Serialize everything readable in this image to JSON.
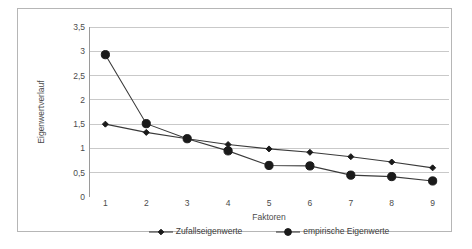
{
  "chart_data": {
    "type": "line",
    "title": "",
    "xlabel": "Faktoren",
    "ylabel": "Eigenwertverlauf",
    "categories": [
      1,
      2,
      3,
      4,
      5,
      6,
      7,
      8,
      9
    ],
    "x": [
      1,
      2,
      3,
      4,
      5,
      6,
      7,
      8,
      9
    ],
    "xlim": [
      0.6,
      9.4
    ],
    "ylim": [
      0,
      3.5
    ],
    "y_ticks": [
      "0",
      "0,5",
      "1",
      "1,5",
      "2",
      "2,5",
      "3",
      "3,5"
    ],
    "y_tick_values": [
      0,
      0.5,
      1,
      1.5,
      2,
      2.5,
      3,
      3.5
    ],
    "x_ticks": [
      "1",
      "2",
      "3",
      "4",
      "5",
      "6",
      "7",
      "8",
      "9"
    ],
    "grid": "horizontal",
    "legend_position": "bottom",
    "series": [
      {
        "name": "Zufallseigenwerte",
        "values": [
          1.5,
          1.33,
          1.2,
          1.08,
          0.99,
          0.92,
          0.83,
          0.72,
          0.6
        ],
        "color": "#1a1a1a",
        "marker": "diamond"
      },
      {
        "name": "empirische Eigenwerte",
        "values": [
          2.93,
          1.51,
          1.2,
          0.95,
          0.65,
          0.64,
          0.45,
          0.42,
          0.33
        ],
        "color": "#1a1a1a",
        "marker": "circle"
      }
    ]
  },
  "axes": {
    "y_title": "Eigenwertverlauf",
    "x_title": "Faktoren"
  },
  "legend": {
    "items": [
      {
        "label": "Zufallseigenwerte"
      },
      {
        "label": "empirische Eigenwerte"
      }
    ]
  },
  "caption": {
    "text": ""
  },
  "colors": {
    "series_line": "#3a3a3a",
    "gridline": "#c9c9c9",
    "axis": "#9a9a9a",
    "frame": "#b6b6b6",
    "text": "#4b4b4b"
  }
}
